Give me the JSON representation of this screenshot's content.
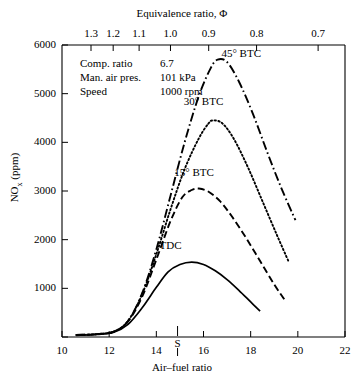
{
  "chart_data": {
    "type": "line",
    "title": "",
    "xlabel": "Air–fuel ratio",
    "ylabel": "NOx (ppm)",
    "top_axis_label": "Equivalence ratio, Φ",
    "xlim": [
      10,
      22
    ],
    "ylim": [
      0,
      6000
    ],
    "xticks": [
      "10",
      "12",
      "14",
      "16",
      "18",
      "20",
      "22"
    ],
    "xtick_values": [
      10,
      12,
      14,
      16,
      18,
      20,
      22
    ],
    "yticks": [
      "0",
      "1000",
      "2000",
      "3000",
      "4000",
      "5000",
      "6000"
    ],
    "ytick_values": [
      0,
      1000,
      2000,
      3000,
      4000,
      5000,
      6000
    ],
    "top_ticks": [
      "1.3",
      "1.2",
      "1.1",
      "1.0",
      "0.9",
      "0.8",
      "0.7"
    ],
    "top_tick_values": [
      1.3,
      1.2,
      1.1,
      1.0,
      0.9,
      0.8,
      0.7
    ],
    "top_tick_afr": [
      11.23,
      12.17,
      13.27,
      14.6,
      16.22,
      18.25,
      20.86
    ],
    "grid": false,
    "legend_position": "inline-annotations",
    "stoich_marker": {
      "label": "S",
      "afr": 14.9
    },
    "series": [
      {
        "name": "45° BTC",
        "style": "dash-dot",
        "peak_x": 16.6,
        "peak_y": 5700,
        "points": [
          [
            10.6,
            40
          ],
          [
            11.5,
            60
          ],
          [
            12.2,
            110
          ],
          [
            12.8,
            330
          ],
          [
            13.4,
            900
          ],
          [
            14.0,
            1800
          ],
          [
            14.6,
            2900
          ],
          [
            15.2,
            4000
          ],
          [
            15.8,
            4950
          ],
          [
            16.3,
            5520
          ],
          [
            16.6,
            5700
          ],
          [
            17.0,
            5650
          ],
          [
            17.5,
            5250
          ],
          [
            18.1,
            4580
          ],
          [
            18.7,
            3800
          ],
          [
            19.3,
            3060
          ],
          [
            19.9,
            2400
          ]
        ]
      },
      {
        "name": "30° BTC",
        "style": "dotted",
        "peak_x": 16.4,
        "peak_y": 4450,
        "points": [
          [
            10.6,
            40
          ],
          [
            11.5,
            60
          ],
          [
            12.2,
            110
          ],
          [
            12.8,
            330
          ],
          [
            13.4,
            880
          ],
          [
            14.0,
            1700
          ],
          [
            14.6,
            2620
          ],
          [
            15.2,
            3450
          ],
          [
            15.8,
            4080
          ],
          [
            16.2,
            4380
          ],
          [
            16.4,
            4450
          ],
          [
            16.8,
            4390
          ],
          [
            17.3,
            4060
          ],
          [
            17.9,
            3470
          ],
          [
            18.5,
            2790
          ],
          [
            19.1,
            2110
          ],
          [
            19.6,
            1560
          ]
        ]
      },
      {
        "name": "15° BTC",
        "style": "dashed",
        "peak_x": 15.8,
        "peak_y": 3050,
        "points": [
          [
            10.6,
            40
          ],
          [
            11.5,
            60
          ],
          [
            12.2,
            110
          ],
          [
            12.8,
            320
          ],
          [
            13.4,
            830
          ],
          [
            14.0,
            1590
          ],
          [
            14.6,
            2380
          ],
          [
            15.1,
            2870
          ],
          [
            15.5,
            3020
          ],
          [
            15.8,
            3050
          ],
          [
            16.2,
            2990
          ],
          [
            16.7,
            2790
          ],
          [
            17.2,
            2480
          ],
          [
            17.8,
            2040
          ],
          [
            18.4,
            1560
          ],
          [
            19.0,
            1080
          ],
          [
            19.5,
            720
          ]
        ]
      },
      {
        "name": "TDC",
        "style": "solid",
        "peak_x": 15.5,
        "peak_y": 1540,
        "points": [
          [
            10.6,
            35
          ],
          [
            11.5,
            55
          ],
          [
            12.2,
            100
          ],
          [
            12.8,
            260
          ],
          [
            13.4,
            600
          ],
          [
            14.0,
            1020
          ],
          [
            14.5,
            1340
          ],
          [
            15.0,
            1490
          ],
          [
            15.5,
            1540
          ],
          [
            16.0,
            1490
          ],
          [
            16.5,
            1360
          ],
          [
            17.0,
            1180
          ],
          [
            17.5,
            960
          ],
          [
            18.0,
            720
          ],
          [
            18.4,
            530
          ]
        ]
      }
    ],
    "annotations": [
      {
        "id": "label-45",
        "text": "45° BTC",
        "x": 17.6,
        "y": 5820
      },
      {
        "id": "label-30",
        "text": "30° BTC",
        "x": 16.0,
        "y": 4830
      },
      {
        "id": "label-15",
        "text": "15° BTC",
        "x": 15.6,
        "y": 3370
      },
      {
        "id": "label-tdc",
        "text": "TDC",
        "x": 14.6,
        "y": 1880
      }
    ],
    "notes": [
      {
        "key": "Comp. ratio",
        "value": "6.7"
      },
      {
        "key": "Man. air pres.",
        "value": "101 kPa"
      },
      {
        "key": "Speed",
        "value": "1000 rpm"
      }
    ]
  },
  "colors": {
    "axis": "#000000",
    "curve": "#000000",
    "background": "#ffffff"
  }
}
